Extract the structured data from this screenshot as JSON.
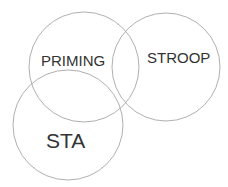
{
  "diagram": {
    "type": "venn",
    "stroke_color": "#b0b0b0",
    "text_color": "#333333",
    "sets": [
      {
        "label": "PRIMING",
        "cx": 84,
        "cy": 67,
        "r": 55
      },
      {
        "label": "STROOP",
        "cx": 166,
        "cy": 67,
        "r": 54
      },
      {
        "label": "STA",
        "cx": 68,
        "cy": 125,
        "r": 55
      }
    ]
  }
}
